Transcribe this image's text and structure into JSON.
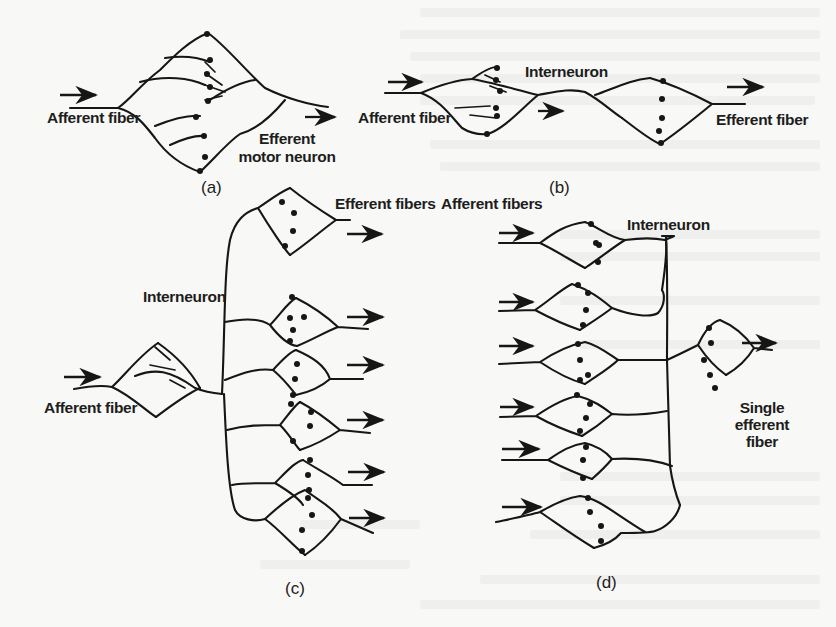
{
  "figure": {
    "panels": [
      {
        "id": "a",
        "tag": "(a)",
        "labels": {
          "input": "Afferent fiber",
          "output_line1": "Efferent",
          "output_line2": "motor neuron"
        }
      },
      {
        "id": "b",
        "tag": "(b)",
        "labels": {
          "input": "Afferent fiber",
          "middle": "Interneuron",
          "output": "Efferent fiber"
        }
      },
      {
        "id": "c",
        "tag": "(c)",
        "labels": {
          "input": "Afferent fiber",
          "middle": "Interneuron",
          "outputs": "Efferent fibers"
        },
        "output_count": 6
      },
      {
        "id": "d",
        "tag": "(d)",
        "labels": {
          "inputs": "Afferent fibers",
          "middle": "Interneuron",
          "output_line1": "Single",
          "output_line2": "efferent",
          "output_line3": "fiber"
        },
        "input_count": 6
      }
    ],
    "colors": {
      "ink": "#161616",
      "paper": "#f8f8f6",
      "bleed_through": "#ececea"
    }
  }
}
